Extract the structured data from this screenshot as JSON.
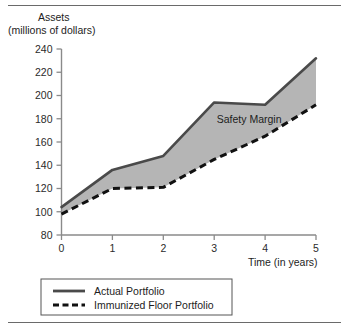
{
  "chart_data": {
    "type": "line",
    "title": "Assets",
    "subtitle": "(millions of dollars)",
    "xlabel": "Time (in years)",
    "ylabel": "Assets (millions of dollars)",
    "x": [
      0,
      1,
      2,
      3,
      4,
      5
    ],
    "xtick_labels": [
      "0",
      "1",
      "2",
      "3",
      "4",
      "5"
    ],
    "ytick_labels": [
      "80",
      "100",
      "120",
      "140",
      "160",
      "180",
      "200",
      "220",
      "240"
    ],
    "yticks": [
      80,
      100,
      120,
      140,
      160,
      180,
      200,
      220,
      240
    ],
    "xlim": [
      0,
      5
    ],
    "ylim": [
      80,
      240
    ],
    "grid": false,
    "legend_position": "bottom-left",
    "series": [
      {
        "name": "Actual Portfolio",
        "style": "solid",
        "color": "#4a4a4a",
        "values": [
          104,
          136,
          148,
          194,
          192,
          232
        ]
      },
      {
        "name": "Immunized Floor Portfolio",
        "style": "dashed",
        "color": "#111111",
        "values": [
          98,
          120,
          121,
          145,
          165,
          192
        ]
      }
    ],
    "fill_between": {
      "label": "Safety Margin",
      "color": "#b5b5b5",
      "upper_series": "Actual Portfolio",
      "lower_series": "Immunized Floor Portfolio"
    },
    "annotations": [
      {
        "text": "Safety Margin",
        "x": 3.05,
        "y": 176
      }
    ]
  },
  "legend": {
    "entries": [
      {
        "label": "Actual Portfolio",
        "style": "solid"
      },
      {
        "label": "Immunized Floor Portfolio",
        "style": "dashed"
      }
    ]
  },
  "axis_titles": {
    "y_line1": "Assets",
    "y_line2": "(millions of dollars)",
    "x": "Time (in years)"
  }
}
